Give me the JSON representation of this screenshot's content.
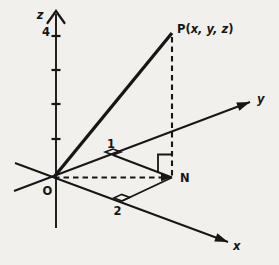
{
  "figure_title": "Point P(x, y, z) in 3-space with foot of perpendicular N in the xy-plane",
  "colors": {
    "paper": "#f2f0ec",
    "ink": "#161616"
  },
  "canvas": {
    "width": 279,
    "height": 265
  },
  "origin": {
    "label": "O",
    "x": 54,
    "y": 177,
    "label_x": 47.5,
    "label_y": 195
  },
  "axes": {
    "z": {
      "label": "z",
      "x": 56,
      "y_top": 12,
      "y_bottom": 228,
      "label_x": 40,
      "label_y": 19,
      "ticks_y": [
        139,
        104,
        70,
        36
      ],
      "tick_half_len": 4.5,
      "tick_label": "4",
      "tick_label_x": 46,
      "tick_label_y": 36
    },
    "y": {
      "label": "y",
      "x1": 14,
      "y1": 191,
      "x2": 250,
      "y2": 102,
      "label_x": 257,
      "label_y": 103
    },
    "x": {
      "label": "x",
      "x1": 15,
      "y1": 163,
      "x2": 228,
      "y2": 242,
      "label_x": 233,
      "label_y": 250
    }
  },
  "points": {
    "P": {
      "label": "P(x, y, z)",
      "x": 172,
      "y": 33,
      "label_x": 177,
      "label_y": 33
    },
    "N": {
      "label": "N",
      "x": 172,
      "y": 177.5,
      "label_x": 180,
      "label_y": 182
    },
    "foot_on_y": {
      "label": "1",
      "x": 113,
      "y": 155,
      "label_x": 111,
      "label_y": 148
    },
    "foot_on_x": {
      "label": "2",
      "x": 122,
      "y": 201,
      "label_x": 117.5,
      "label_y": 215
    }
  },
  "style": {
    "axis_width": 1.9,
    "op_width": 3.3,
    "dash_width": 2.1,
    "dash_pattern": "5.5 4",
    "marker_size": 8.5,
    "arrow_len": 13,
    "arrow_half_w": 4.4,
    "font_size": 11.5
  }
}
